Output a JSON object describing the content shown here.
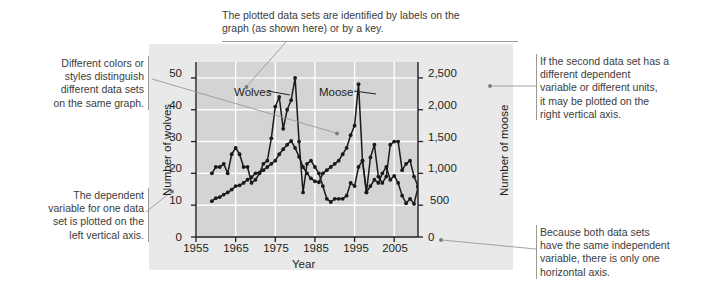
{
  "chart_data": {
    "type": "line",
    "title": "",
    "xlabel": "Year",
    "ylabel": "Number of wolves",
    "y2label": "Number of moose",
    "xlim": [
      1955,
      2011
    ],
    "ylim": [
      0,
      55
    ],
    "y2lim": [
      0,
      2750
    ],
    "xticks": [
      "1955",
      "1965",
      "1975",
      "1985",
      "1995",
      "2005"
    ],
    "xtick_values": [
      1955,
      1965,
      1975,
      1985,
      1995,
      2005
    ],
    "yticks": [
      "0",
      "10",
      "20",
      "30",
      "40",
      "50"
    ],
    "ytick_values": [
      0,
      10,
      20,
      30,
      40,
      50
    ],
    "y2ticks": [
      "0",
      "500",
      "1,000",
      "1,500",
      "2,000",
      "2,500"
    ],
    "y2tick_values": [
      0,
      500,
      1000,
      1500,
      2000,
      2500
    ],
    "grid": true,
    "legend_position": "in-plot-labels",
    "series": [
      {
        "name": "Wolves",
        "axis": "left",
        "label_text": "Wolves",
        "x": [
          1959,
          1960,
          1961,
          1962,
          1963,
          1964,
          1965,
          1966,
          1967,
          1968,
          1969,
          1970,
          1971,
          1972,
          1973,
          1974,
          1975,
          1976,
          1977,
          1978,
          1979,
          1980,
          1981,
          1982,
          1983,
          1984,
          1985,
          1986,
          1987,
          1988,
          1989,
          1990,
          1991,
          1992,
          1993,
          1994,
          1995,
          1996,
          1997,
          1998,
          1999,
          2000,
          2001,
          2002,
          2003,
          2004,
          2005,
          2006,
          2007,
          2008,
          2009,
          2010,
          2011
        ],
        "values": [
          20,
          22,
          22,
          23,
          20,
          26,
          28,
          26,
          22,
          22,
          17,
          18,
          20,
          23,
          24,
          31,
          41,
          44,
          34,
          40,
          43,
          50,
          30,
          14,
          23,
          24,
          22,
          20,
          16,
          12,
          11,
          12,
          12,
          12,
          13,
          17,
          16,
          22,
          24,
          14,
          25,
          29,
          19,
          17,
          19,
          29,
          30,
          30,
          21,
          23,
          24,
          19,
          16
        ]
      },
      {
        "name": "Moose",
        "axis": "right",
        "label_text": "Moose",
        "x": [
          1959,
          1960,
          1961,
          1962,
          1963,
          1964,
          1965,
          1966,
          1967,
          1968,
          1969,
          1970,
          1971,
          1972,
          1973,
          1974,
          1975,
          1976,
          1977,
          1978,
          1979,
          1980,
          1981,
          1982,
          1983,
          1984,
          1985,
          1986,
          1987,
          1988,
          1989,
          1990,
          1991,
          1992,
          1993,
          1994,
          1995,
          1996,
          1997,
          1998,
          1999,
          2000,
          2001,
          2002,
          2003,
          2004,
          2005,
          2006,
          2007,
          2008,
          2009,
          2010,
          2011
        ],
        "values": [
          563,
          610,
          628,
          667,
          700,
          745,
          800,
          812,
          850,
          900,
          940,
          1000,
          1010,
          1050,
          1100,
          1150,
          1200,
          1300,
          1380,
          1450,
          1510,
          1400,
          1260,
          1100,
          1000,
          920,
          875,
          860,
          1000,
          1050,
          1100,
          1150,
          1200,
          1300,
          1400,
          1600,
          1750,
          2400,
          1200,
          700,
          800,
          900,
          850,
          1000,
          1100,
          900,
          960,
          850,
          650,
          530,
          600,
          520,
          780
        ]
      }
    ]
  },
  "axis_labels": {
    "left_axis_title": "Number of wolves",
    "right_axis_title": "Number of moose",
    "x_axis_title": "Year"
  },
  "annotations": [
    {
      "id": "styles",
      "text": "Different colors or\nstyles distinguish\ndifferent data sets\non the same graph.",
      "align": "right"
    },
    {
      "id": "labels-key",
      "text": "The plotted data sets are identified by labels on the\ngraph (as shown here) or by a key.",
      "align": "left"
    },
    {
      "id": "right-axis",
      "text": "If the second data set has a\ndifferent dependent\nvariable or different units,\nit may be plotted on the\nright vertical axis.",
      "align": "left"
    },
    {
      "id": "left-axis",
      "text": "The dependent\nvariable for one data\nset is plotted on the\nleft vertical axis.",
      "align": "right"
    },
    {
      "id": "horizontal-axis",
      "text": "Because both data sets\nhave the same independent\nvariable, there is only one\nhorizontal axis.",
      "align": "left"
    }
  ],
  "colors": {
    "page_background": "#ffffff",
    "figure_panel": "#e9e9e9",
    "plot_background": "#d4d4d4",
    "gridline": "#ffffff",
    "series_line": "#1a1a1a",
    "axis": "#231f20",
    "callout_text": "#3c3c3c",
    "leader_line": "#9a9a9a"
  }
}
